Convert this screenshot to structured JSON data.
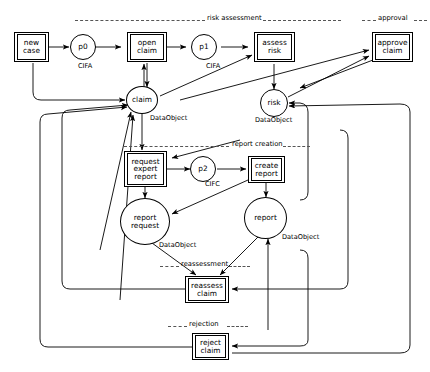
{
  "diagram": {
    "type": "petri-net",
    "colors": {
      "stroke": "#000000",
      "background": "#ffffff",
      "dashed": "#555555"
    },
    "sections": [
      {
        "id": "risk-assessment",
        "label": "risk assessment"
      },
      {
        "id": "approval",
        "label": "approval"
      },
      {
        "id": "report-creation",
        "label": "report creation"
      },
      {
        "id": "reassessment",
        "label": "reassessment"
      },
      {
        "id": "rejection",
        "label": "rejection"
      }
    ],
    "transitions": [
      {
        "id": "new-case",
        "lines": [
          "new",
          "case"
        ]
      },
      {
        "id": "open-claim",
        "lines": [
          "open",
          "claim"
        ]
      },
      {
        "id": "assess-risk",
        "lines": [
          "assess",
          "risk"
        ]
      },
      {
        "id": "approve-claim",
        "lines": [
          "approve",
          "claim"
        ]
      },
      {
        "id": "request-expert-report",
        "lines": [
          "request",
          "expert",
          "report"
        ]
      },
      {
        "id": "create-report",
        "lines": [
          "create",
          "report"
        ]
      },
      {
        "id": "reassess-claim",
        "lines": [
          "reassess",
          "claim"
        ]
      },
      {
        "id": "reject-claim",
        "lines": [
          "reject",
          "claim"
        ]
      }
    ],
    "places": [
      {
        "id": "p0",
        "lines": [
          "p0"
        ],
        "object_label": "CIFA"
      },
      {
        "id": "p1",
        "lines": [
          "p1"
        ],
        "object_label": "CIFA"
      },
      {
        "id": "p2",
        "lines": [
          "p2"
        ],
        "object_label": "CIFC"
      },
      {
        "id": "claim",
        "lines": [
          "claim"
        ],
        "object_label": "DataObject"
      },
      {
        "id": "risk",
        "lines": [
          "risk"
        ],
        "object_label": "DataObject"
      },
      {
        "id": "report-request",
        "lines": [
          "report",
          "request"
        ],
        "object_label": "DataObject"
      },
      {
        "id": "report",
        "lines": [
          "report"
        ],
        "object_label": "DataObject"
      }
    ]
  }
}
